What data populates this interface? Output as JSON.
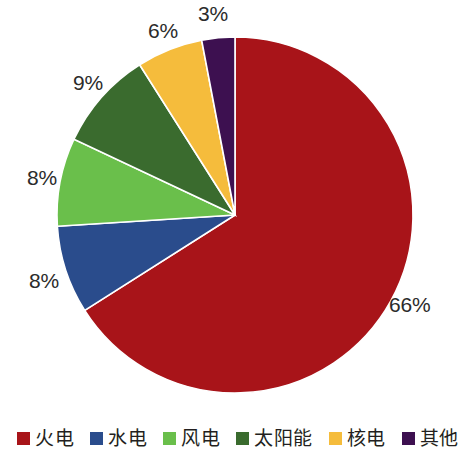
{
  "chart_data": {
    "type": "pie",
    "title": "",
    "subtitle": "",
    "xlabel": "",
    "ylabel": "",
    "grid": false,
    "legend_position": "bottom",
    "start_angle_deg": 0,
    "direction": "clockwise",
    "center": {
      "x": 235,
      "y": 215
    },
    "radius": 178,
    "categories": [
      "火电",
      "水电",
      "风电",
      "太阳能",
      "核电",
      "其他"
    ],
    "values": [
      66,
      8,
      8,
      9,
      6,
      3
    ],
    "value_labels": [
      "66%",
      "8%",
      "8%",
      "9%",
      "6%",
      "3%"
    ],
    "colors": [
      "#a81419",
      "#2a4c8c",
      "#6abf4b",
      "#3a6b2e",
      "#f5bc3c",
      "#3d1050"
    ],
    "slices": [
      {
        "name": "火电",
        "value": 66,
        "label": "66%",
        "color": "#a81419"
      },
      {
        "name": "水电",
        "value": 8,
        "label": "8%",
        "color": "#2a4c8c"
      },
      {
        "name": "风电",
        "value": 8,
        "label": "8%",
        "color": "#6abf4b"
      },
      {
        "name": "太阳能",
        "value": 9,
        "label": "9%",
        "color": "#3a6b2e"
      },
      {
        "name": "核电",
        "value": 6,
        "label": "6%",
        "color": "#f5bc3c"
      },
      {
        "name": "其他",
        "value": 3,
        "label": "3%",
        "color": "#3d1050"
      }
    ]
  },
  "labels": {
    "thermal": "66%",
    "hydro": "8%",
    "wind": "8%",
    "solar": "9%",
    "nuclear": "6%",
    "other": "3%"
  },
  "legend": {
    "items": [
      {
        "label": "火电",
        "color": "#a81419"
      },
      {
        "label": "水电",
        "color": "#2a4c8c"
      },
      {
        "label": "风电",
        "color": "#6abf4b"
      },
      {
        "label": "太阳能",
        "color": "#3a6b2e"
      },
      {
        "label": "核电",
        "color": "#f5bc3c"
      },
      {
        "label": "其他",
        "color": "#3d1050"
      }
    ]
  }
}
